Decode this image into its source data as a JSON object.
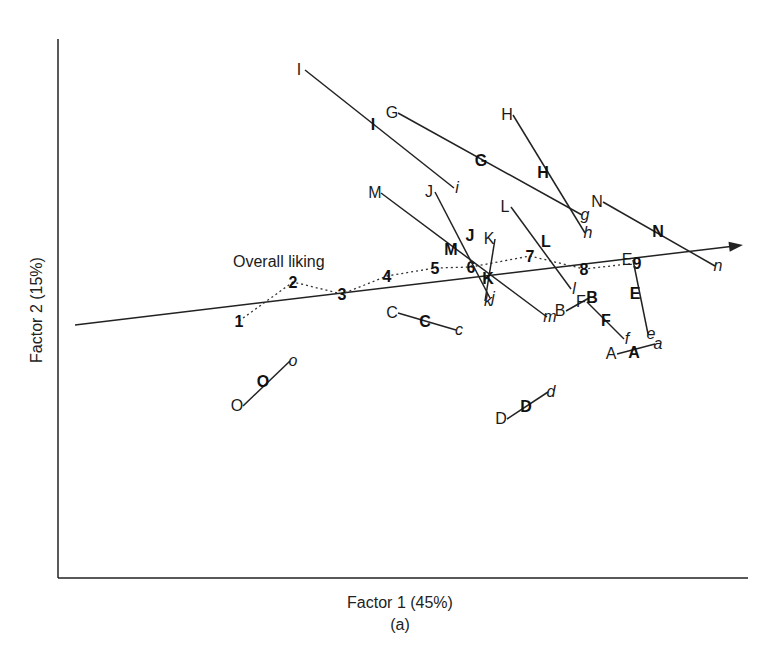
{
  "chart_data": {
    "type": "scatter",
    "title": "",
    "xlabel": "Factor 1 (45%)",
    "ylabel": "Factor 2 (15%)",
    "caption": "(a)",
    "grid": false,
    "legend": null,
    "axes": {
      "x_axis_y": 578,
      "y_axis_x": 58,
      "x_axis_end": 748,
      "y_axis_top": 39
    },
    "overall_liking": {
      "label": "Overall liking",
      "vector": {
        "x1": 75,
        "y1": 325,
        "x2": 743,
        "y2": 245
      },
      "scale_points": [
        {
          "label": "1",
          "x": 239,
          "y": 326
        },
        {
          "label": "2",
          "x": 293,
          "y": 287
        },
        {
          "label": "3",
          "x": 342,
          "y": 299
        },
        {
          "label": "4",
          "x": 387,
          "y": 281
        },
        {
          "label": "5",
          "x": 435,
          "y": 273
        },
        {
          "label": "6",
          "x": 471,
          "y": 272
        },
        {
          "label": "7",
          "x": 530,
          "y": 261
        },
        {
          "label": "8",
          "x": 584,
          "y": 274
        },
        {
          "label": "9",
          "x": 637,
          "y": 268
        }
      ]
    },
    "products": [
      {
        "id": "A",
        "upper": {
          "x": 611,
          "y": 359
        },
        "bold": {
          "x": 634,
          "y": 358
        },
        "lower": {
          "x": 658,
          "y": 349
        }
      },
      {
        "id": "B",
        "upper": {
          "x": 560,
          "y": 316
        },
        "bold": {
          "x": 592,
          "y": 303
        },
        "lower": null
      },
      {
        "id": "C",
        "upper": {
          "x": 392,
          "y": 318
        },
        "bold": {
          "x": 425,
          "y": 327
        },
        "lower": {
          "x": 459,
          "y": 335
        }
      },
      {
        "id": "D",
        "upper": {
          "x": 501,
          "y": 424
        },
        "bold": {
          "x": 526,
          "y": 412
        },
        "lower": {
          "x": 551,
          "y": 397
        }
      },
      {
        "id": "E",
        "upper": {
          "x": 627,
          "y": 265
        },
        "bold": {
          "x": 635,
          "y": 299
        },
        "lower": {
          "x": 651,
          "y": 339
        }
      },
      {
        "id": "F",
        "upper": {
          "x": 581,
          "y": 307
        },
        "bold": {
          "x": 606,
          "y": 326
        },
        "lower": {
          "x": 627,
          "y": 344
        }
      },
      {
        "id": "G",
        "upper": {
          "x": 392,
          "y": 118
        },
        "bold": {
          "x": 481,
          "y": 166
        },
        "lower": {
          "x": 585,
          "y": 220
        }
      },
      {
        "id": "H",
        "upper": {
          "x": 507,
          "y": 120
        },
        "bold": {
          "x": 543,
          "y": 178
        },
        "lower": {
          "x": 588,
          "y": 238
        }
      },
      {
        "id": "I",
        "upper": {
          "x": 299,
          "y": 75
        },
        "bold": {
          "x": 373,
          "y": 130
        },
        "lower": {
          "x": 457,
          "y": 193
        }
      },
      {
        "id": "J",
        "upper": {
          "x": 429,
          "y": 197
        },
        "bold": {
          "x": 470,
          "y": 241
        },
        "lower": {
          "x": 493,
          "y": 303
        }
      },
      {
        "id": "K",
        "upper": {
          "x": 489,
          "y": 244
        },
        "bold": {
          "x": 488,
          "y": 284
        },
        "lower": {
          "x": 488,
          "y": 306
        }
      },
      {
        "id": "L",
        "upper": {
          "x": 505,
          "y": 212
        },
        "bold": {
          "x": 546,
          "y": 247
        },
        "lower": {
          "x": 574,
          "y": 294
        }
      },
      {
        "id": "M",
        "upper": {
          "x": 375,
          "y": 198
        },
        "bold": {
          "x": 451,
          "y": 255
        },
        "lower": {
          "x": 550,
          "y": 322
        }
      },
      {
        "id": "N",
        "upper": {
          "x": 597,
          "y": 207
        },
        "bold": {
          "x": 658,
          "y": 237
        },
        "lower": {
          "x": 718,
          "y": 271
        }
      },
      {
        "id": "O",
        "upper": {
          "x": 237,
          "y": 411
        },
        "bold": {
          "x": 263,
          "y": 387
        },
        "lower": {
          "x": 293,
          "y": 366
        }
      }
    ],
    "notation": {
      "upper_case": "regular upper-case letter at one end of each product segment",
      "bold_upper_case": "bold upper-case letter along the segment (product mean)",
      "lower_case_italic": "italic lower-case letter at the other end"
    }
  }
}
